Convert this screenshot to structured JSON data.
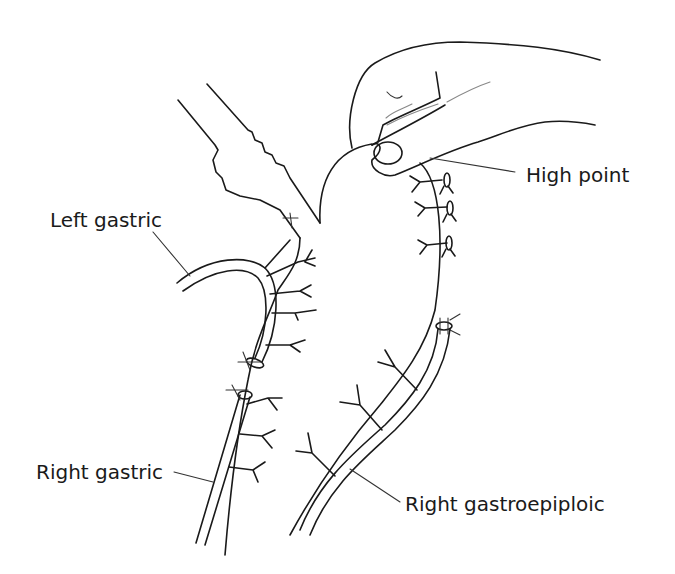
{
  "figure": {
    "labels": {
      "left_gastric": "Left gastric",
      "high_point": "High point",
      "right_gastric": "Right gastric",
      "right_gastroepiploic": "Right gastroepiploic"
    },
    "colors": {
      "line": "#1a1a1a",
      "background": "#ffffff"
    }
  }
}
